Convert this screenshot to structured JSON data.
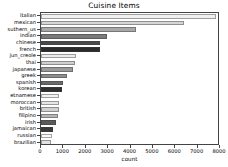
{
  "chart_data": {
    "type": "bar",
    "orientation": "horizontal",
    "title": "Cuisine Items",
    "xlabel": "count",
    "ylabel": "",
    "xlim": [
      0,
      8000
    ],
    "xticks": [
      0,
      1000,
      2000,
      3000,
      4000,
      5000,
      6000,
      7000,
      8000
    ],
    "xtick_labels": [
      "0",
      "1000",
      "2000",
      "3000",
      "4000",
      "5000",
      "6000",
      "7000",
      "8000"
    ],
    "grid": false,
    "legend": null,
    "categories": [
      "italian",
      "mexican",
      "suthern_us",
      "indian",
      "chinese",
      "french",
      "jun_creole",
      "thai",
      "japanese",
      "greek",
      "spanish",
      "korean",
      "etnamese",
      "moroccan",
      "british",
      "filipino",
      "irish",
      "jamaican",
      "russian",
      "brazilian"
    ],
    "values": [
      7820,
      6380,
      4240,
      2960,
      2640,
      2620,
      1550,
      1520,
      1420,
      1160,
      980,
      960,
      810,
      800,
      800,
      760,
      660,
      520,
      490,
      460
    ],
    "bar_colors": [
      "#f0f0f0",
      "#d6d6d6",
      "#a8a8a8",
      "#7a7a7a",
      "#4a4a4a",
      "#2a2a2a",
      "#ededed",
      "#cfcfcf",
      "#9a9a9a",
      "#8e8e8e",
      "#6a6a6a",
      "#2f2f2f",
      "#f2f2f2",
      "#e6e6e6",
      "#d0d0d0",
      "#b8b8b8",
      "#5a5a5a",
      "#3a3a3a",
      "#fafafa",
      "#e2e2e2"
    ]
  }
}
